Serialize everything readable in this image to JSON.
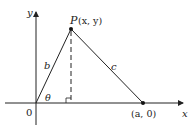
{
  "diagram": {
    "axes": {
      "x_label": "x",
      "y_label": "y",
      "origin_label": "0"
    },
    "points": {
      "P": {
        "name": "P",
        "coords": "(x, y)"
      },
      "A": {
        "label": "(a, 0)"
      }
    },
    "sides": {
      "b": "b",
      "c": "c"
    },
    "angle": "θ",
    "colors": {
      "stroke": "#222222",
      "background": "#ffffff"
    }
  }
}
